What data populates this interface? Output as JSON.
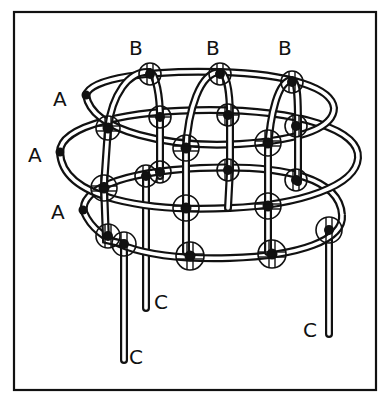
{
  "figure": {
    "frame": {
      "x": 14,
      "y": 12,
      "width": 362,
      "height": 378,
      "stroke": "#111111"
    },
    "colors": {
      "ink": "#111111",
      "background": "#ffffff"
    }
  },
  "labels": {
    "B": [
      {
        "text": "B",
        "x": 129,
        "y": 55
      },
      {
        "text": "B",
        "x": 206,
        "y": 55
      },
      {
        "text": "B",
        "x": 278,
        "y": 55
      }
    ],
    "A": [
      {
        "text": "A",
        "x": 53,
        "y": 106
      },
      {
        "text": "A",
        "x": 28,
        "y": 162
      },
      {
        "text": "A",
        "x": 51,
        "y": 219
      }
    ],
    "C": [
      {
        "text": "C",
        "x": 154,
        "y": 309
      },
      {
        "text": "C",
        "x": 129,
        "y": 364
      },
      {
        "text": "C",
        "x": 303,
        "y": 337
      }
    ]
  },
  "parts": {
    "A": "horizontal ring ends (3 rings)",
    "B": "vertical loop tops (3 loops)",
    "C": "hanging leg ends (3 legs)"
  },
  "nodes_count": 20
}
